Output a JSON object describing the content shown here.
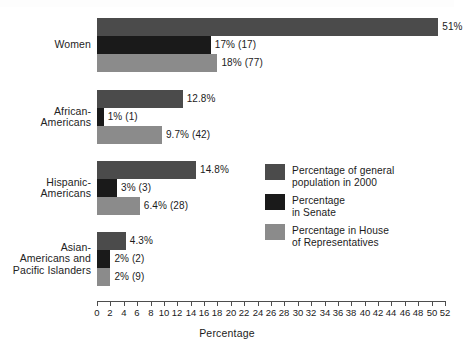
{
  "chart_data": {
    "type": "bar",
    "orientation": "horizontal",
    "title": "",
    "xlabel": "Percentage",
    "ylabel": "",
    "xlim": [
      0,
      52
    ],
    "xtick_step": 2,
    "xticks": [
      0,
      2,
      4,
      6,
      8,
      10,
      12,
      14,
      16,
      18,
      20,
      22,
      24,
      26,
      28,
      30,
      32,
      34,
      36,
      38,
      40,
      42,
      44,
      46,
      48,
      50,
      52
    ],
    "grid": false,
    "legend_position": "center-right",
    "categories": [
      "Women",
      "African-\nAmericans",
      "Hispanic-\nAmericans",
      "Asian-\nAmericans and\nPacific Islanders"
    ],
    "series": [
      {
        "name": "Percentage of general\npopulation in 2000",
        "color": "#4b4b4b",
        "values": [
          51,
          12.8,
          14.8,
          4.3
        ],
        "labels": [
          "51%",
          "12.8%",
          "14.8%",
          "4.3%"
        ]
      },
      {
        "name": "Percentage\nin Senate",
        "color": "#1a1a1a",
        "values": [
          17,
          1,
          3,
          2
        ],
        "labels": [
          "17% (17)",
          "1% (1)",
          "3% (3)",
          "2% (2)"
        ]
      },
      {
        "name": "Percentage in House\nof Representatives",
        "color": "#8b8b8b",
        "values": [
          18,
          9.7,
          6.4,
          2
        ],
        "labels": [
          "18% (77)",
          "9.7% (42)",
          "6.4% (28)",
          "2% (9)"
        ]
      }
    ]
  },
  "colors": {
    "series_general": "#4b4b4b",
    "series_senate": "#1a1a1a",
    "series_house": "#8b8b8b",
    "axis": "#4d4d4d",
    "text": "#1b1b1b",
    "background": "#ffffff"
  }
}
